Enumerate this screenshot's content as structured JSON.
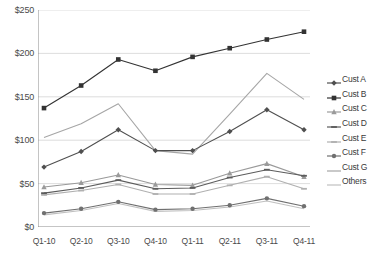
{
  "chart_data": {
    "type": "line",
    "title": "",
    "xlabel": "",
    "ylabel": "",
    "categories": [
      "Q1-10",
      "Q2-10",
      "Q3-10",
      "Q4-10",
      "Q1-11",
      "Q2-11",
      "Q3-11",
      "Q4-11"
    ],
    "ylim": [
      0,
      250
    ],
    "yticks": [
      0,
      50,
      100,
      150,
      200,
      250
    ],
    "ytick_labels": [
      "$0",
      "$50",
      "$100",
      "$150",
      "$200",
      "$250"
    ],
    "grid": "horizontal",
    "legend_position": "right",
    "series": [
      {
        "name": "Cust A",
        "color": "#4f4f4f",
        "marker": "diamond",
        "values": [
          69,
          87,
          112,
          88,
          88,
          110,
          135,
          112
        ]
      },
      {
        "name": "Cust B",
        "color": "#333333",
        "marker": "square",
        "values": [
          137,
          163,
          193,
          180,
          196,
          206,
          216,
          225
        ]
      },
      {
        "name": "Cust C",
        "color": "#9a9a9a",
        "marker": "triangle",
        "values": [
          46,
          51,
          60,
          49,
          48,
          62,
          73,
          58
        ]
      },
      {
        "name": "Cust D",
        "color": "#5c5c5c",
        "marker": "dash",
        "values": [
          39,
          45,
          54,
          44,
          45,
          57,
          66,
          59
        ]
      },
      {
        "name": "Cust E",
        "color": "#b0b0b0",
        "marker": "dash",
        "values": [
          37,
          42,
          49,
          38,
          38,
          48,
          58,
          44
        ]
      },
      {
        "name": "Cust F",
        "color": "#707070",
        "marker": "circle",
        "values": [
          16,
          21,
          29,
          20,
          21,
          25,
          33,
          24
        ]
      },
      {
        "name": "Cust G",
        "color": "#a6a6a6",
        "marker": "none",
        "values": [
          103,
          119,
          142,
          88,
          84,
          130,
          177,
          147
        ]
      },
      {
        "name": "Others",
        "color": "#c0c0c0",
        "marker": "none",
        "values": [
          14,
          19,
          27,
          18,
          19,
          23,
          30,
          21
        ]
      }
    ]
  },
  "caption": {
    "text": ""
  }
}
